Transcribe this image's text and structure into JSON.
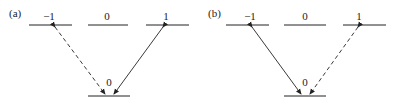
{
  "panels": [
    {
      "label": "(a)",
      "levels_top": [
        "−1",
        "0",
        "1"
      ],
      "level_bottom": "0",
      "transitions": [
        {
          "from": "−1",
          "to": "0",
          "style": "dashed"
        },
        {
          "from": "1",
          "to": "0",
          "style": "solid"
        }
      ]
    },
    {
      "label": "(b)",
      "levels_top": [
        "−1",
        "0",
        "1"
      ],
      "level_bottom": "0",
      "transitions": [
        {
          "from": "−1",
          "to": "0",
          "style": "solid"
        },
        {
          "from": "1",
          "to": "0",
          "style": "dashed"
        }
      ]
    }
  ]
}
